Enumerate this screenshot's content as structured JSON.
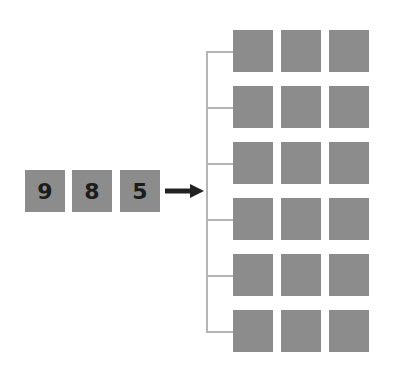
{
  "input_digits": [
    "9",
    "8",
    "5"
  ],
  "colors": {
    "square_fill": "#8c8c8c",
    "digit_color": "#1c1c1c",
    "arrow_color": "#222222",
    "bracket_color": "#b5b5b5"
  },
  "grid": {
    "rows": 6,
    "columns": 3
  }
}
